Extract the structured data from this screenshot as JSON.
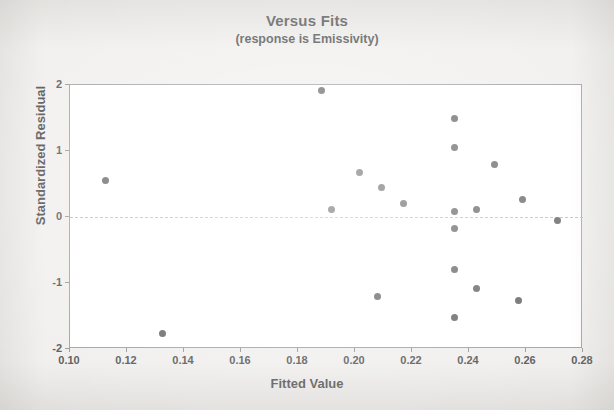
{
  "chart_data": {
    "type": "scatter",
    "title": "Versus Fits",
    "subtitle": "(response is Emissivity)",
    "xlabel": "Fitted Value",
    "ylabel": "Standardized Residual",
    "xlim": [
      0.1,
      0.28
    ],
    "ylim": [
      -2,
      2
    ],
    "xticks": [
      "0.10",
      "0.12",
      "0.14",
      "0.16",
      "0.18",
      "0.20",
      "0.22",
      "0.24",
      "0.26",
      "0.28"
    ],
    "xtick_values": [
      0.1,
      0.12,
      0.14,
      0.16,
      0.18,
      0.2,
      0.22,
      0.24,
      0.26,
      0.28
    ],
    "yticks": [
      "2",
      "1",
      "0",
      "-1",
      "-2"
    ],
    "ytick_values": [
      2,
      1,
      0,
      -1,
      -2
    ],
    "grid": false,
    "legend": false,
    "reference_line": {
      "axis": "y",
      "value": 0,
      "style": "dashed",
      "color": "#b9b9b9"
    },
    "marker": {
      "shape": "circle",
      "color": "#595959",
      "size": 7
    },
    "points": [
      {
        "x": 0.1124,
        "y": 0.55
      },
      {
        "x": 0.1326,
        "y": -1.76
      },
      {
        "x": 0.1883,
        "y": 1.92
      },
      {
        "x": 0.1919,
        "y": 0.12
      },
      {
        "x": 0.2016,
        "y": 0.68
      },
      {
        "x": 0.2094,
        "y": 0.44
      },
      {
        "x": 0.2169,
        "y": 0.2
      },
      {
        "x": 0.208,
        "y": -1.2
      },
      {
        "x": 0.2349,
        "y": 1.5
      },
      {
        "x": 0.2349,
        "y": 1.05
      },
      {
        "x": 0.2349,
        "y": 0.08
      },
      {
        "x": 0.2349,
        "y": -0.17
      },
      {
        "x": 0.2349,
        "y": -0.8
      },
      {
        "x": 0.2349,
        "y": -1.53
      },
      {
        "x": 0.2427,
        "y": 0.12
      },
      {
        "x": 0.2427,
        "y": -1.09
      },
      {
        "x": 0.249,
        "y": 0.79
      },
      {
        "x": 0.2586,
        "y": 0.26
      },
      {
        "x": 0.2575,
        "y": -1.27
      },
      {
        "x": 0.2711,
        "y": -0.06
      }
    ]
  },
  "colors": {
    "background": "#efeeec",
    "plot_area": "#ffffff",
    "marker": "#595959",
    "axis": "#9a9a9a",
    "text": "#3d3d3d",
    "reference_line": "#b9b9b9"
  }
}
